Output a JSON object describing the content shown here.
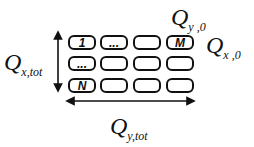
{
  "diagram": {
    "grid": {
      "rows": 3,
      "cols": 4,
      "cells": [
        [
          "1",
          "...",
          "",
          "M"
        ],
        [
          "...",
          "",
          "",
          ""
        ],
        [
          "N",
          "",
          "",
          ""
        ]
      ]
    },
    "labels": {
      "q_y0": {
        "main": "Q",
        "sub": "y ,0"
      },
      "q_x0": {
        "main": "Q",
        "sub": "x ,0"
      },
      "q_xtot": {
        "main": "Q",
        "sub": "x,tot"
      },
      "q_ytot": {
        "main": "Q",
        "sub": "y,tot"
      }
    },
    "arrows": {
      "vertical": "double-headed, spans rows (Q_x,tot)",
      "horizontal": "double-headed, spans columns (Q_y,tot)"
    }
  }
}
